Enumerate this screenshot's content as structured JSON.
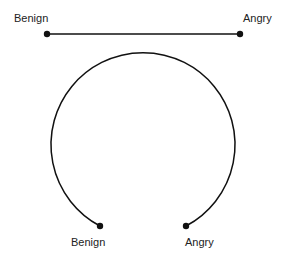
{
  "linear_scale": {
    "left_label": "Benign",
    "right_label": "Angry"
  },
  "circular_scale": {
    "left_label": "Benign",
    "right_label": "Angry"
  },
  "colors": {
    "stroke": "#111111",
    "text": "#222222",
    "background": "#ffffff"
  }
}
